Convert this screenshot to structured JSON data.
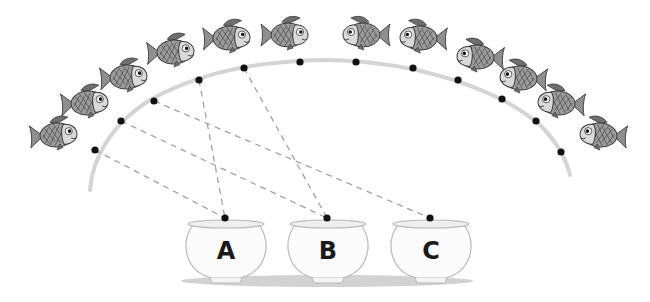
{
  "colors": {
    "background": "#ffffff",
    "arc": "#d4d4d4",
    "dot": "#111111",
    "dashed_line": "#9a9a9a",
    "fish_body": "#9b9b9b",
    "fish_head": "#d9d9d9",
    "fish_fin": "#6f6f6f",
    "fish_outline": "#3a3a3a",
    "bowl_fill": "#fbfbfb",
    "bowl_outline": "#b8b8b8",
    "bowl_shadow": "#d2d2d2"
  },
  "fish": [
    {
      "id": 1,
      "x": 57,
      "y": 135,
      "facing": "right"
    },
    {
      "id": 2,
      "x": 88,
      "y": 103,
      "facing": "right"
    },
    {
      "id": 3,
      "x": 127,
      "y": 77,
      "facing": "right"
    },
    {
      "id": 4,
      "x": 174,
      "y": 52,
      "facing": "right"
    },
    {
      "id": 5,
      "x": 230,
      "y": 38,
      "facing": "right"
    },
    {
      "id": 6,
      "x": 288,
      "y": 35,
      "facing": "right"
    },
    {
      "id": 7,
      "x": 363,
      "y": 35,
      "facing": "left"
    },
    {
      "id": 8,
      "x": 420,
      "y": 38,
      "facing": "left"
    },
    {
      "id": 9,
      "x": 477,
      "y": 57,
      "facing": "left"
    },
    {
      "id": 10,
      "x": 520,
      "y": 78,
      "facing": "left"
    },
    {
      "id": 11,
      "x": 558,
      "y": 103,
      "facing": "left"
    },
    {
      "id": 12,
      "x": 600,
      "y": 135,
      "facing": "left"
    }
  ],
  "dots": [
    {
      "id": 1,
      "x": 95,
      "y": 150
    },
    {
      "id": 2,
      "x": 121,
      "y": 121
    },
    {
      "id": 3,
      "x": 154,
      "y": 101
    },
    {
      "id": 4,
      "x": 199,
      "y": 80
    },
    {
      "id": 5,
      "x": 244,
      "y": 68
    },
    {
      "id": 6,
      "x": 300,
      "y": 62
    },
    {
      "id": 7,
      "x": 356,
      "y": 62
    },
    {
      "id": 8,
      "x": 413,
      "y": 68
    },
    {
      "id": 9,
      "x": 458,
      "y": 80
    },
    {
      "id": 10,
      "x": 502,
      "y": 99
    },
    {
      "id": 11,
      "x": 536,
      "y": 121
    },
    {
      "id": 12,
      "x": 561,
      "y": 152
    }
  ],
  "bowls": [
    {
      "label": "A",
      "cx": 226,
      "rim_y": 222,
      "dot": {
        "x": 225,
        "y": 218
      }
    },
    {
      "label": "B",
      "cx": 328,
      "rim_y": 222,
      "dot": {
        "x": 327,
        "y": 218
      }
    },
    {
      "label": "C",
      "cx": 431,
      "rim_y": 222,
      "dot": {
        "x": 430,
        "y": 218
      }
    }
  ],
  "connections": [
    {
      "from_dot": 1,
      "to_bowl": "A"
    },
    {
      "from_dot": 2,
      "to_bowl": "B"
    },
    {
      "from_dot": 3,
      "to_bowl": "C"
    },
    {
      "from_dot": 4,
      "to_bowl": "A"
    },
    {
      "from_dot": 5,
      "to_bowl": "B"
    }
  ]
}
